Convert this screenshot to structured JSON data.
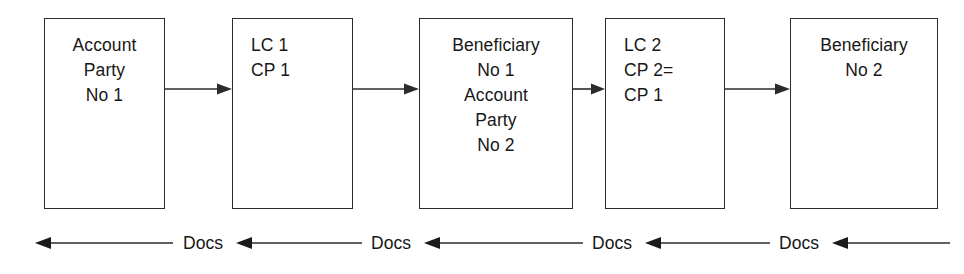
{
  "diagram": {
    "background_color": "#ffffff",
    "stroke_color": "#2b2b2b",
    "text_color": "#171717",
    "nodes": [
      {
        "id": "node-account-party-1",
        "name": "account-party-1-box",
        "lines": [
          "Account",
          "Party",
          "No 1"
        ]
      },
      {
        "id": "node-lc-1",
        "name": "lc-1-box",
        "lines": [
          "LC 1",
          "CP 1"
        ]
      },
      {
        "id": "node-beneficiary-1",
        "name": "beneficiary-1-account-party-2-box",
        "lines": [
          "Beneficiary",
          "No 1",
          "Account",
          "Party",
          "No 2"
        ]
      },
      {
        "id": "node-lc-2",
        "name": "lc-2-box",
        "lines": [
          "LC 2",
          "CP 2=",
          "CP 1"
        ]
      },
      {
        "id": "node-beneficiary-2",
        "name": "beneficiary-2-box",
        "lines": [
          "Beneficiary",
          "No 2"
        ]
      }
    ],
    "forward_arrows": [
      {
        "name": "arrow-account-party-1-to-lc-1",
        "direction": "right"
      },
      {
        "name": "arrow-lc-1-to-beneficiary-1",
        "direction": "right"
      },
      {
        "name": "arrow-beneficiary-1-to-lc-2",
        "direction": "right"
      },
      {
        "name": "arrow-lc-2-to-beneficiary-2",
        "direction": "right"
      }
    ],
    "document_flow": {
      "label": "Docs",
      "direction": "left",
      "labels": [
        "Docs",
        "Docs",
        "Docs",
        "Docs"
      ],
      "arrow_count": 5
    }
  }
}
